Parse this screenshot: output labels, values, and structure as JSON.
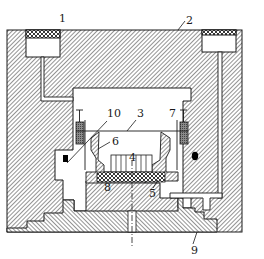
{
  "figure": {
    "type": "mechanical cross-section diagram",
    "colors": {
      "background": "#ffffff",
      "outline": "#1a1a1a",
      "hatch": "#3a3a3a",
      "seal": "#000000"
    },
    "labels": [
      {
        "id": "1",
        "text": "1",
        "x": 59,
        "y": 22,
        "leader": null
      },
      {
        "id": "2",
        "text": "2",
        "x": 186,
        "y": 24,
        "leader": [
          [
            185,
            21
          ],
          [
            178,
            30
          ]
        ]
      },
      {
        "id": "3",
        "text": "3",
        "x": 137,
        "y": 117,
        "leader": [
          [
            136,
            120
          ],
          [
            127,
            131
          ]
        ]
      },
      {
        "id": "4",
        "text": "4",
        "x": 129,
        "y": 161,
        "leader": null
      },
      {
        "id": "5",
        "text": "5",
        "x": 149,
        "y": 197,
        "leader": [
          [
            153,
            188
          ],
          [
            158,
            180
          ]
        ]
      },
      {
        "id": "6",
        "text": "6",
        "x": 112,
        "y": 145,
        "leader": [
          [
            110,
            142
          ],
          [
            98,
            149
          ]
        ]
      },
      {
        "id": "7",
        "text": "7",
        "x": 169,
        "y": 117,
        "leader": null
      },
      {
        "id": "8",
        "text": "8",
        "x": 104,
        "y": 191,
        "leader": null
      },
      {
        "id": "9",
        "text": "9",
        "x": 191,
        "y": 254,
        "leader": [
          [
            193,
            244
          ],
          [
            197,
            232
          ]
        ]
      },
      {
        "id": "10",
        "text": "10",
        "x": 107,
        "y": 117,
        "leader": [
          [
            107,
            121
          ],
          [
            67,
            163
          ]
        ]
      }
    ]
  }
}
